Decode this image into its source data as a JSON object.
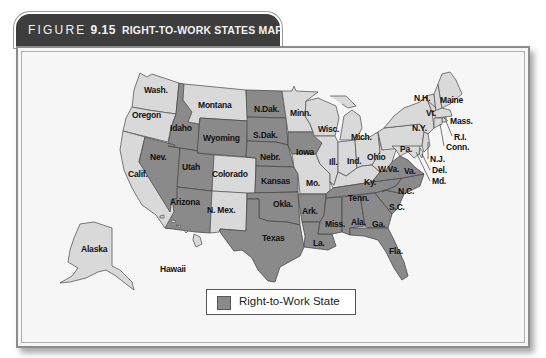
{
  "figure": {
    "label": "FIGURE",
    "number": "9.15",
    "title": "RIGHT-TO-WORK STATES MAP"
  },
  "legend": {
    "label": "Right-to-Work State",
    "swatch_color": "#8a8a8a"
  },
  "colors": {
    "right_to_work": "#8a8a8a",
    "not_right_to_work": "#d9d9d9",
    "header_bg": "#3d3d3d"
  },
  "states": [
    {
      "label": "Wash.",
      "right_to_work": false
    },
    {
      "label": "Oregon",
      "right_to_work": false
    },
    {
      "label": "Calif.",
      "right_to_work": false
    },
    {
      "label": "Idaho",
      "right_to_work": true
    },
    {
      "label": "Nev.",
      "right_to_work": true
    },
    {
      "label": "Montana",
      "right_to_work": false
    },
    {
      "label": "Wyoming",
      "right_to_work": true
    },
    {
      "label": "Utah",
      "right_to_work": true
    },
    {
      "label": "Arizona",
      "right_to_work": true
    },
    {
      "label": "Colorado",
      "right_to_work": false
    },
    {
      "label": "N. Mex.",
      "right_to_work": false
    },
    {
      "label": "N.Dak.",
      "right_to_work": true
    },
    {
      "label": "S.Dak.",
      "right_to_work": true
    },
    {
      "label": "Nebr.",
      "right_to_work": true
    },
    {
      "label": "Kansas",
      "right_to_work": true
    },
    {
      "label": "Okla.",
      "right_to_work": true
    },
    {
      "label": "Texas",
      "right_to_work": true
    },
    {
      "label": "Minn.",
      "right_to_work": false
    },
    {
      "label": "Iowa",
      "right_to_work": true
    },
    {
      "label": "Mo.",
      "right_to_work": false
    },
    {
      "label": "Ark.",
      "right_to_work": true
    },
    {
      "label": "La.",
      "right_to_work": true
    },
    {
      "label": "Wisc.",
      "right_to_work": false
    },
    {
      "label": "Ill.",
      "right_to_work": false
    },
    {
      "label": "Mich.",
      "right_to_work": false
    },
    {
      "label": "Ind.",
      "right_to_work": false
    },
    {
      "label": "Ohio",
      "right_to_work": false
    },
    {
      "label": "Ky.",
      "right_to_work": false
    },
    {
      "label": "Tenn.",
      "right_to_work": true
    },
    {
      "label": "Miss.",
      "right_to_work": true
    },
    {
      "label": "Ala.",
      "right_to_work": true
    },
    {
      "label": "Ga.",
      "right_to_work": true
    },
    {
      "label": "Fla.",
      "right_to_work": true
    },
    {
      "label": "S.C.",
      "right_to_work": true
    },
    {
      "label": "N.C.",
      "right_to_work": true
    },
    {
      "label": "Va.",
      "right_to_work": true
    },
    {
      "label": "W.Va.",
      "right_to_work": false
    },
    {
      "label": "Pa.",
      "right_to_work": false
    },
    {
      "label": "N.Y.",
      "right_to_work": false
    },
    {
      "label": "Vt.",
      "right_to_work": false
    },
    {
      "label": "N.H.",
      "right_to_work": false
    },
    {
      "label": "Maine",
      "right_to_work": false
    },
    {
      "label": "Mass.",
      "right_to_work": false
    },
    {
      "label": "R.I.",
      "right_to_work": false
    },
    {
      "label": "Conn.",
      "right_to_work": false
    },
    {
      "label": "N.J.",
      "right_to_work": false
    },
    {
      "label": "Del.",
      "right_to_work": false
    },
    {
      "label": "Md.",
      "right_to_work": false
    },
    {
      "label": "Alaska",
      "right_to_work": false
    },
    {
      "label": "Hawaii",
      "right_to_work": false
    }
  ]
}
